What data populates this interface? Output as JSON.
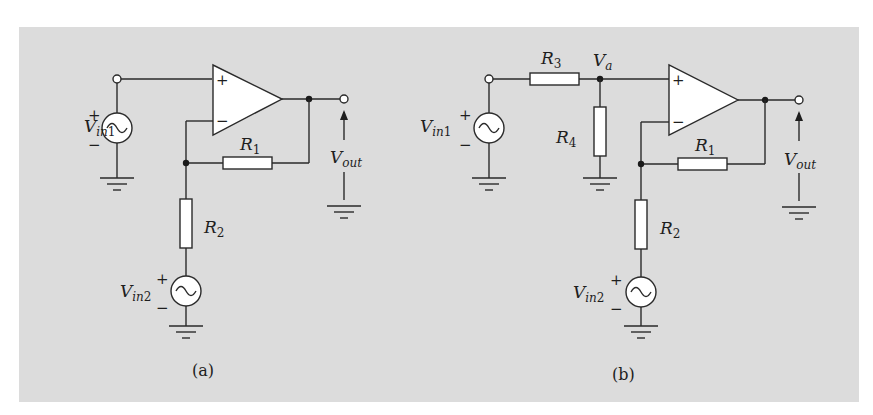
{
  "figure": {
    "background": "#dcdcdc",
    "panels": [
      {
        "id": "a",
        "caption": "(a)",
        "labels": {
          "vin1_main": "V",
          "vin1_sub": "in",
          "vin1_num": "1",
          "vin2_main": "V",
          "vin2_sub": "in",
          "vin2_num": "2",
          "r1_main": "R",
          "r1_num": "1",
          "r2_main": "R",
          "r2_num": "2",
          "vout_main": "V",
          "vout_sub": "out",
          "plus": "+",
          "minus": "−"
        }
      },
      {
        "id": "b",
        "caption": "(b)",
        "labels": {
          "vin1_main": "V",
          "vin1_sub": "in",
          "vin1_num": "1",
          "vin2_main": "V",
          "vin2_sub": "in",
          "vin2_num": "2",
          "r1_main": "R",
          "r1_num": "1",
          "r2_main": "R",
          "r2_num": "2",
          "r3_main": "R",
          "r3_num": "3",
          "r4_main": "R",
          "r4_num": "4",
          "va_main": "V",
          "va_sub": "a",
          "vout_main": "V",
          "vout_sub": "out",
          "plus": "+",
          "minus": "−"
        }
      }
    ]
  }
}
